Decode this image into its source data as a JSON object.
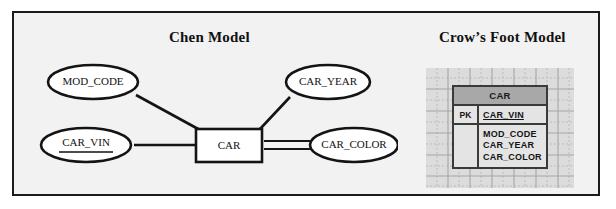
{
  "figure": {
    "panels": [
      {
        "id": "chen",
        "title": "Chen Model"
      },
      {
        "id": "crow",
        "title": "Crow’s Foot Model"
      }
    ]
  },
  "chen_model": {
    "entity": {
      "label": "CAR"
    },
    "attributes": [
      {
        "label": "MOD_CODE",
        "primary_key": false,
        "multivalued": false
      },
      {
        "label": "CAR_VIN",
        "primary_key": true,
        "multivalued": false
      },
      {
        "label": "CAR_YEAR",
        "primary_key": false,
        "multivalued": false
      },
      {
        "label": "CAR_COLOR",
        "primary_key": false,
        "multivalued": true
      }
    ]
  },
  "crow_foot_model": {
    "table_name": "CAR",
    "key_marker": "PK",
    "key_field": "CAR_VIN",
    "attributes": [
      "MOD_CODE",
      "CAR_YEAR",
      "CAR_COLOR"
    ]
  },
  "colors": {
    "canvas": "#f2f2f2",
    "frame_border": "#1b1b1b",
    "stroke": "#141414",
    "grid_background": "#dcdcdc",
    "table_header": "#a8a8a8",
    "table_body": "#e4e4e4",
    "table_border": "#3a3a3a"
  }
}
